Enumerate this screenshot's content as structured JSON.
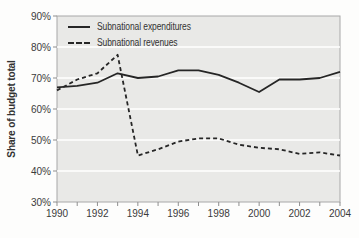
{
  "chart_data": {
    "type": "line",
    "title": "",
    "xlabel": "",
    "ylabel": "Share of budget total",
    "x": [
      1990,
      1991,
      1992,
      1993,
      1994,
      1995,
      1996,
      1997,
      1998,
      1999,
      2000,
      2001,
      2002,
      2003,
      2004
    ],
    "series": [
      {
        "name": "Subnational expenditures",
        "line_style": "solid",
        "values": [
          67,
          67.5,
          68.5,
          71.5,
          70,
          70.5,
          72.5,
          72.5,
          71,
          68.5,
          65.5,
          69.5,
          69.5,
          70,
          72
        ]
      },
      {
        "name": "Subnational revenues",
        "line_style": "dashed",
        "values": [
          66,
          69.5,
          71.5,
          77.5,
          45,
          47,
          49.5,
          50.5,
          50.5,
          48.5,
          47.5,
          47,
          45.5,
          46,
          45
        ]
      }
    ],
    "xlim": [
      1990,
      2004
    ],
    "ylim": [
      30,
      90
    ],
    "y_tick_step": 10,
    "y_tick_suffix": "%",
    "x_major_tick_step": 2,
    "x_minor_tick_step": 1,
    "grid": "horizontal white gridlines on gray plot background",
    "legend_position": "top-left inside plot",
    "colors": {
      "line": "#262626",
      "plot_background": "#e9e9e7",
      "gridline": "#ffffff",
      "border": "#a8a8a8",
      "tick": "#8f8f8f",
      "text": "#3b3b3b"
    }
  }
}
